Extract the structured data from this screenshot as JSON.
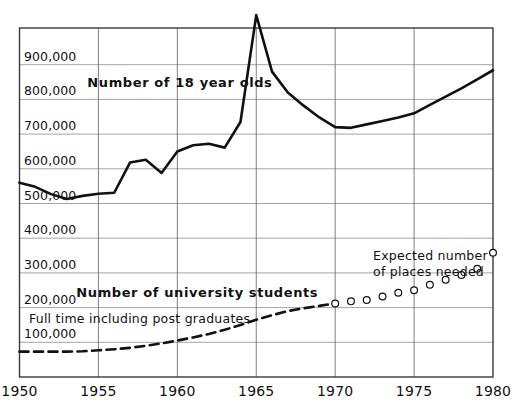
{
  "chart_data": {
    "type": "line",
    "title": "",
    "subtitle": "",
    "xlabel": "",
    "ylabel": "",
    "xlim": [
      1950,
      1980
    ],
    "ylim": [
      0,
      1010000
    ],
    "grid": true,
    "legend_position": "inline-annotations",
    "x_ticks": [
      "1950",
      "1955",
      "1960",
      "1965",
      "1970",
      "1975",
      "1980"
    ],
    "x_tick_values": [
      1950,
      1955,
      1960,
      1965,
      1970,
      1975,
      1980
    ],
    "y_ticks": [
      "100,000",
      "200,000",
      "300,000",
      "400,000",
      "500,000",
      "600,000",
      "700,000",
      "800,000",
      "900,000"
    ],
    "y_tick_values": [
      100000,
      200000,
      300000,
      400000,
      500000,
      600000,
      700000,
      800000,
      900000
    ],
    "annotations": [
      {
        "id": "eighteen-year-olds-label",
        "text": "Number of 18 year olds",
        "x": 1954.3,
        "y": 845000,
        "style": "bold"
      },
      {
        "id": "university-students-label",
        "text": "Number of university students",
        "x": 1953.6,
        "y": 238000,
        "style": "bold"
      },
      {
        "id": "full-time-label",
        "text": "Full time including post graduates",
        "x": 1950.6,
        "y": 160000,
        "style": "regular"
      },
      {
        "id": "expected-places-label",
        "text": "Expected number\nof places needed",
        "line1": "Expected number",
        "line2": "of places needed",
        "x": 1972.4,
        "y": 345000,
        "style": "regular-two-line"
      }
    ],
    "series": [
      {
        "name": "Number of 18 year olds",
        "marker": "none",
        "linestyle": "solid",
        "color": "#111111",
        "linewidth": 2.6,
        "x": [
          1950,
          1951,
          1952,
          1953,
          1954,
          1955,
          1956,
          1957,
          1958,
          1959,
          1960,
          1961,
          1962,
          1963,
          1964,
          1965,
          1966,
          1967,
          1968,
          1969,
          1970,
          1971,
          1972,
          1973,
          1974,
          1975,
          1976,
          1977,
          1978,
          1979,
          1980
        ],
        "values": [
          560000,
          548000,
          527000,
          513000,
          522000,
          528000,
          531000,
          618000,
          626000,
          588000,
          650000,
          668000,
          672000,
          661000,
          735000,
          1043000,
          880000,
          820000,
          782000,
          748000,
          720000,
          718000,
          728000,
          738000,
          748000,
          760000,
          784000,
          808000,
          832000,
          858000,
          884000
        ]
      },
      {
        "name": "Number of university students (full time including post graduates)",
        "marker": "none",
        "linestyle": "dashed",
        "color": "#111111",
        "linewidth": 2.6,
        "x": [
          1950,
          1951,
          1952,
          1953,
          1954,
          1955,
          1956,
          1957,
          1958,
          1959,
          1960,
          1961,
          1962,
          1963,
          1964,
          1965,
          1966,
          1967,
          1968,
          1969,
          1970
        ],
        "values": [
          73000,
          73000,
          73000,
          73000,
          74000,
          77000,
          80000,
          84000,
          90000,
          97000,
          105000,
          114000,
          124000,
          136000,
          150000,
          165000,
          178000,
          190000,
          198000,
          205000,
          212000
        ]
      },
      {
        "name": "Expected number of places needed",
        "marker": "circle-open",
        "linestyle": "none",
        "color": "#111111",
        "linewidth": 1.2,
        "x": [
          1970,
          1971,
          1972,
          1973,
          1974,
          1975,
          1976,
          1977,
          1978,
          1979,
          1980
        ],
        "values": [
          212000,
          218000,
          222000,
          232000,
          243000,
          250000,
          266000,
          280000,
          294000,
          312000,
          358000
        ]
      }
    ]
  }
}
